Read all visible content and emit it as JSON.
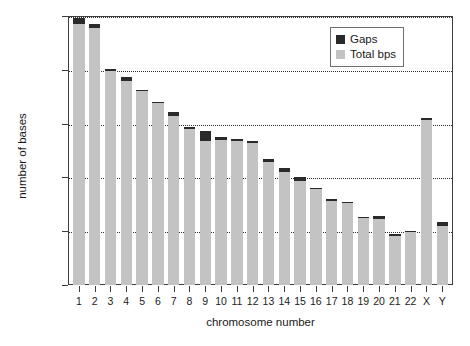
{
  "chart_data": {
    "type": "bar",
    "title": "",
    "xlabel": "chromosome number",
    "ylabel": "number of bases",
    "ylim": [
      0,
      250000000
    ],
    "grid": true,
    "legend_position": "top-right",
    "stacked": true,
    "categories": [
      "1",
      "2",
      "3",
      "4",
      "5",
      "6",
      "7",
      "8",
      "9",
      "10",
      "11",
      "12",
      "13",
      "14",
      "15",
      "16",
      "17",
      "18",
      "19",
      "20",
      "21",
      "22",
      "X",
      "Y"
    ],
    "ytick_labels": [
      "0.0E+00",
      "5.0E+07",
      "1.0E+08",
      "1.5E+08",
      "2.0E+08",
      "2.5E+08"
    ],
    "ytick_values": [
      0,
      50000000,
      100000000,
      150000000,
      200000000,
      250000000
    ],
    "series": [
      {
        "name": "Total bps",
        "color": "#c3c3c3",
        "values": [
          243000000,
          239000000,
          199000000,
          190000000,
          180000000,
          169000000,
          157000000,
          145000000,
          134000000,
          135000000,
          134000000,
          132000000,
          114000000,
          105000000,
          97000000,
          89000000,
          78000000,
          76000000,
          62000000,
          61000000,
          46000000,
          49000000,
          153000000,
          55000000
        ]
      },
      {
        "name": "Gaps",
        "color": "#2a2a2a",
        "values": [
          5000000,
          4000000,
          1500000,
          3500000,
          1500000,
          1500000,
          3500000,
          1500000,
          9000000,
          2500000,
          2000000,
          2000000,
          3500000,
          3500000,
          3500000,
          1500000,
          1500000,
          1500000,
          1500000,
          3000000,
          1500000,
          1500000,
          2500000,
          3500000
        ]
      }
    ]
  },
  "legend": {
    "items": [
      {
        "label": "Gaps",
        "swatch": "dark-swatch"
      },
      {
        "label": "Total bps",
        "swatch": "light-swatch"
      }
    ]
  }
}
